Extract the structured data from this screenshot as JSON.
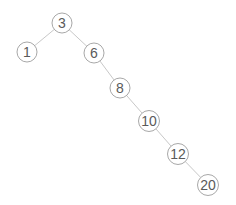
{
  "diagram": {
    "type": "binary-search-tree",
    "nodes": [
      {
        "id": "n3",
        "label": "3",
        "x": 62,
        "y": 23
      },
      {
        "id": "n1",
        "label": "1",
        "x": 27,
        "y": 52
      },
      {
        "id": "n6",
        "label": "6",
        "x": 94,
        "y": 53
      },
      {
        "id": "n8",
        "label": "8",
        "x": 120,
        "y": 88
      },
      {
        "id": "n10",
        "label": "10",
        "x": 149,
        "y": 121
      },
      {
        "id": "n12",
        "label": "12",
        "x": 178,
        "y": 154
      },
      {
        "id": "n20",
        "label": "20",
        "x": 208,
        "y": 185
      }
    ],
    "edges": [
      {
        "from": "n3",
        "to": "n1"
      },
      {
        "from": "n3",
        "to": "n6"
      },
      {
        "from": "n6",
        "to": "n8"
      },
      {
        "from": "n8",
        "to": "n10"
      },
      {
        "from": "n10",
        "to": "n12"
      },
      {
        "from": "n12",
        "to": "n20"
      }
    ],
    "node_radius": 10,
    "colors": {
      "edge": "#c8c8c8",
      "node_stroke": "#a8a8a8",
      "label": "#5a5a5a",
      "background": "#ffffff"
    }
  }
}
